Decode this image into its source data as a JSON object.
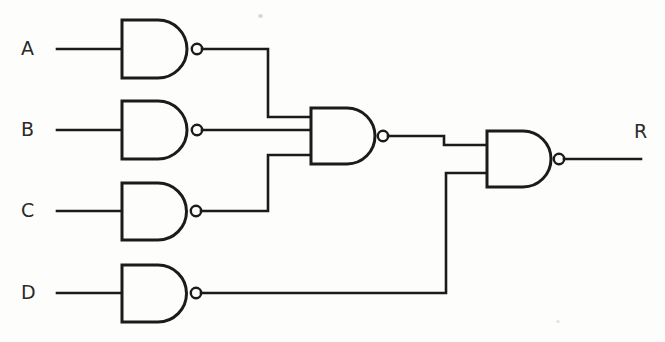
{
  "diagram": {
    "type": "logic-circuit-schematic",
    "background_color": "#fdfdfc",
    "line_color": "#1b1b1b",
    "width": 665,
    "height": 342
  },
  "labels": {
    "input_a": "A",
    "input_b": "B",
    "input_c": "C",
    "input_d": "D",
    "output_r": "R"
  },
  "gates": [
    {
      "id": "gate-a",
      "kind": "NAND",
      "inputs": 1,
      "input_labels": [
        "A"
      ],
      "x": 122,
      "y": 20,
      "w": 71,
      "h": 58,
      "output_y": 49
    },
    {
      "id": "gate-b",
      "kind": "NAND",
      "inputs": 1,
      "input_labels": [
        "B"
      ],
      "x": 122,
      "y": 101,
      "w": 71,
      "h": 58,
      "output_y": 130
    },
    {
      "id": "gate-c",
      "kind": "NAND",
      "inputs": 1,
      "input_labels": [
        "C"
      ],
      "x": 122,
      "y": 183,
      "w": 71,
      "h": 57,
      "output_y": 211
    },
    {
      "id": "gate-d",
      "kind": "NAND",
      "inputs": 1,
      "input_labels": [
        "D"
      ],
      "x": 122,
      "y": 265,
      "w": 71,
      "h": 57,
      "output_y": 293
    },
    {
      "id": "gate-mid",
      "kind": "NAND",
      "inputs": 3,
      "input_labels": [
        "gate-a",
        "gate-b",
        "gate-c"
      ],
      "x": 311,
      "y": 108,
      "w": 71,
      "h": 56,
      "output_y": 130
    },
    {
      "id": "gate-out",
      "kind": "NAND",
      "inputs": 2,
      "input_labels": [
        "gate-mid",
        "gate-d"
      ],
      "x": 487,
      "y": 131,
      "w": 71,
      "h": 56,
      "output_y": 155
    }
  ],
  "nets": [
    {
      "id": "net-in-a",
      "from": "A",
      "to": "gate-a"
    },
    {
      "id": "net-in-b",
      "from": "B",
      "to": "gate-b"
    },
    {
      "id": "net-in-c",
      "from": "C",
      "to": "gate-c"
    },
    {
      "id": "net-in-d",
      "from": "D",
      "to": "gate-d"
    },
    {
      "id": "net-a-mid",
      "from": "gate-a",
      "to": "gate-mid-input-1"
    },
    {
      "id": "net-b-mid",
      "from": "gate-b",
      "to": "gate-mid-input-2"
    },
    {
      "id": "net-c-mid",
      "from": "gate-c",
      "to": "gate-mid-input-3"
    },
    {
      "id": "net-mid-out",
      "from": "gate-mid",
      "to": "gate-out-input-1"
    },
    {
      "id": "net-d-out",
      "from": "gate-d",
      "to": "gate-out-input-2"
    },
    {
      "id": "net-out-r",
      "from": "gate-out",
      "to": "R"
    }
  ],
  "logic": {
    "expression": "R = NAND( NAND( NAND(A), NAND(B), NAND(C) ), NAND(D) )"
  }
}
